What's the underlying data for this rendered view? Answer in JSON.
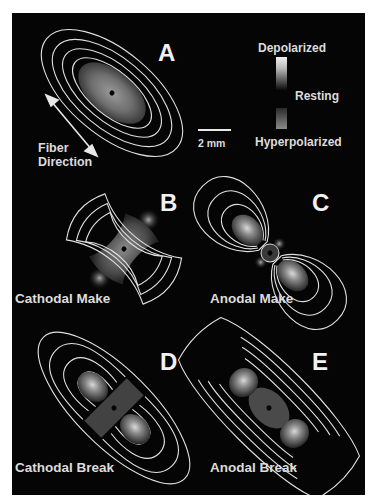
{
  "figure": {
    "background": "#050505",
    "contour_color": "#e0e0e0",
    "panels": [
      {
        "id": "A",
        "letter": "A",
        "caption": "",
        "pattern": "ellipse-depolarized"
      },
      {
        "id": "B",
        "letter": "B",
        "caption": "Cathodal Make"
      },
      {
        "id": "C",
        "letter": "C",
        "caption": "Anodal Make"
      },
      {
        "id": "D",
        "letter": "D",
        "caption": "Cathodal Break"
      },
      {
        "id": "E",
        "letter": "E",
        "caption": "Anodal Break"
      }
    ],
    "fiber_direction": {
      "line1": "Fiber",
      "line2": "Direction"
    },
    "scale_bar": {
      "label": "2 mm"
    },
    "legend": {
      "top": "Depolarized",
      "middle": "Resting",
      "bottom": "Hyperpolarized"
    }
  }
}
